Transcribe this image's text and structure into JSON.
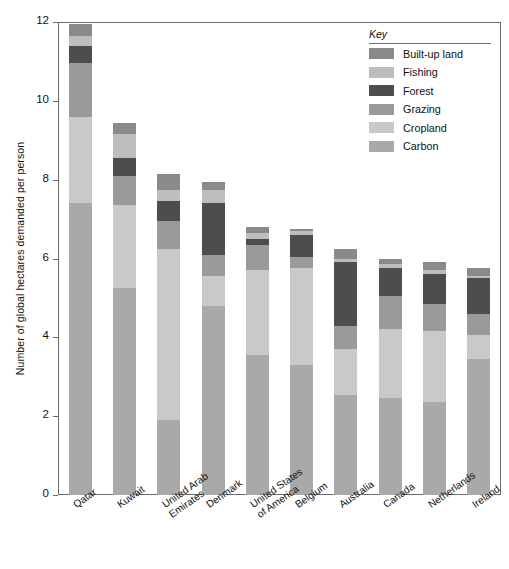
{
  "chart_data": {
    "type": "bar",
    "subtype": "stacked-bar",
    "title": "",
    "xlabel": "",
    "ylabel": "Number of global hectares demanded per person",
    "ylim": [
      0,
      12
    ],
    "yticks": [
      0,
      2,
      4,
      6,
      8,
      10,
      12
    ],
    "ytick_labels": [
      "0",
      "2",
      "4",
      "6",
      "8",
      "10",
      "12"
    ],
    "grid": false,
    "legend_position": "top-right",
    "legend_title": "Key",
    "categories": [
      "Qatar",
      "Kuwait",
      "United Arab Emirates",
      "Denmark",
      "United States of America",
      "Belgium",
      "Australia",
      "Canada",
      "Netherlands",
      "Ireland"
    ],
    "category_lines": [
      [
        "Qatar"
      ],
      [
        "Kuwait"
      ],
      [
        "United Arab",
        "Emirates"
      ],
      [
        "Denmark"
      ],
      [
        "United States",
        "of America"
      ],
      [
        "Belgium"
      ],
      [
        "Australia"
      ],
      [
        "Canada"
      ],
      [
        "Netherlands"
      ],
      [
        "Ireland"
      ]
    ],
    "series": [
      {
        "name": "Carbon",
        "color": "#a9a9a9",
        "values": [
          7.4,
          5.25,
          1.9,
          4.8,
          3.55,
          3.3,
          2.55,
          2.45,
          2.35,
          3.45
        ]
      },
      {
        "name": "Cropland",
        "color": "#c9c9c9",
        "values": [
          2.2,
          2.1,
          4.35,
          0.75,
          2.15,
          2.45,
          1.15,
          1.75,
          1.8,
          0.6
        ]
      },
      {
        "name": "Grazing",
        "color": "#9a9a9a",
        "values": [
          1.35,
          0.75,
          0.7,
          0.55,
          0.65,
          0.3,
          0.6,
          0.85,
          0.7,
          0.55
        ]
      },
      {
        "name": "Forest",
        "color": "#4d4d4d",
        "values": [
          0.45,
          0.45,
          0.5,
          1.3,
          0.15,
          0.55,
          1.6,
          0.7,
          0.75,
          0.9
        ]
      },
      {
        "name": "Fishing",
        "color": "#bdbdbd",
        "values": [
          0.25,
          0.6,
          0.3,
          0.35,
          0.15,
          0.1,
          0.1,
          0.1,
          0.1,
          0.05
        ]
      },
      {
        "name": "Built-up land",
        "color": "#8a8a8a",
        "values": [
          0.3,
          0.3,
          0.4,
          0.2,
          0.15,
          0.05,
          0.25,
          0.15,
          0.2,
          0.2
        ]
      }
    ],
    "totals": [
      11.65,
      9.5,
      8.15,
      7.95,
      6.8,
      6.75,
      6.25,
      6.0,
      5.9,
      5.8
    ]
  },
  "legend": {
    "title": "Key",
    "items": [
      {
        "label": "Built-up land",
        "color": "#8a8a8a"
      },
      {
        "label": "Fishing",
        "color": "#bdbdbd"
      },
      {
        "label": "Forest",
        "color": "#4d4d4d"
      },
      {
        "label": "Grazing",
        "color": "#9a9a9a"
      },
      {
        "label": "Cropland",
        "color": "#c9c9c9"
      },
      {
        "label": "Carbon",
        "color": "#a9a9a9"
      }
    ]
  },
  "axes": {
    "y_title": "Number of global hectares demanded per person"
  }
}
